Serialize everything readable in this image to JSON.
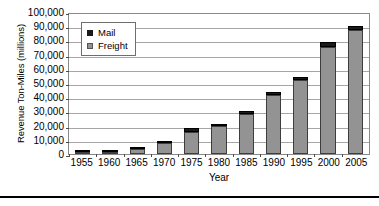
{
  "chart_data": {
    "type": "bar",
    "title": "",
    "xlabel": "Year",
    "ylabel": "Revenue Ton-Miles (millions)",
    "categories": [
      "1955",
      "1960",
      "1965",
      "1970",
      "1975",
      "1980",
      "1985",
      "1990",
      "1995",
      "2000",
      "2005"
    ],
    "series": [
      {
        "name": "Freight",
        "color": "#939393",
        "values": [
          900,
          1700,
          3800,
          7800,
          15500,
          19500,
          28000,
          41500,
          52000,
          75500,
          87000
        ]
      },
      {
        "name": "Mail",
        "color": "#1a1a1a",
        "values": [
          400,
          600,
          500,
          1200,
          2500,
          1500,
          2000,
          2000,
          2500,
          3500,
          3500
        ]
      }
    ],
    "stacked": true,
    "ylim": [
      0,
      100000
    ],
    "yticks": [
      "0",
      "10,000",
      "20,000",
      "30,000",
      "40,000",
      "50,000",
      "60,000",
      "70,000",
      "80,000",
      "90,000",
      "100,000"
    ],
    "ytick_values": [
      0,
      10000,
      20000,
      30000,
      40000,
      50000,
      60000,
      70000,
      80000,
      90000,
      100000
    ],
    "grid": true,
    "legend_position": "top-left-inside",
    "legend": [
      {
        "label": "Mail",
        "color": "#1a1a1a"
      },
      {
        "label": "Freight",
        "color": "#939393"
      }
    ]
  }
}
